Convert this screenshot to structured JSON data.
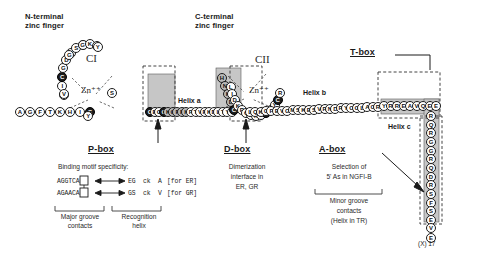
{
  "figure": {
    "title_regions": {
      "n_terminal": "N-terminal\nzinc finger",
      "c_terminal": "C-terminal\nzinc finger"
    },
    "zinc_modules": [
      {
        "id": "CI",
        "label": "CI",
        "zinc_label": "Zn⁺⁺"
      },
      {
        "id": "CII",
        "label": "CII",
        "zinc_label": "Zn⁺⁺"
      }
    ],
    "helices": [
      {
        "name": "helix-a",
        "label": "Helix a"
      },
      {
        "name": "helix-b",
        "label": "Helix b"
      },
      {
        "name": "helix-c",
        "label": "Helix c"
      }
    ],
    "terminus_label": "(X) 17"
  },
  "boxes": [
    {
      "name": "t-box",
      "label": "T-box",
      "caption_lines": []
    },
    {
      "name": "p-box",
      "label": "P-box",
      "caption_lines": [
        "Binding motif specificity:"
      ]
    },
    {
      "name": "d-box",
      "label": "D-box",
      "caption_lines": [
        "Dimerization",
        "interface in",
        "ER, GR"
      ]
    },
    {
      "name": "a-box",
      "label": "A-box",
      "caption_lines": [
        "Selection of",
        "5' As in NGFI-B"
      ]
    }
  ],
  "p_box_detail": {
    "heading": "Binding motif specificity:",
    "rows": [
      {
        "motif": "AGGTCA",
        "boxed_index": 3,
        "arrow": "←→",
        "residues": "EG  ck  A",
        "receptor": "[for ER]"
      },
      {
        "motif": "AGAACA",
        "boxed_index": 3,
        "arrow": "←→",
        "residues": "GS  ck  V",
        "receptor": "[for GR]"
      }
    ],
    "bracket_left": [
      "Major groove",
      "contacts"
    ],
    "bracket_right": [
      "Recognition",
      "helix"
    ]
  },
  "a_box_detail": {
    "bracket_lines": [
      "Minor groove",
      "contacts",
      "(Helix in TR)"
    ]
  },
  "sequence": {
    "n_tail": [
      "A",
      "G",
      "F",
      "T",
      "K",
      "H",
      "I",
      "C"
    ],
    "ci_loop_left": [
      "A",
      "I",
      "C",
      "G",
      "D",
      "R",
      "S",
      "S"
    ],
    "ci_loop_top": [
      "G",
      "K",
      "H"
    ],
    "ci_loop_right": [
      "Y",
      "G",
      "V",
      "Y",
      "S"
    ],
    "helix_a_chain": [
      "C",
      "E",
      "G",
      "C",
      "K",
      "G",
      "F",
      "F",
      "K",
      "R",
      "T",
      "V",
      "R",
      "K",
      "D",
      "L",
      "T",
      "Y",
      "T"
    ],
    "cii_left_block": [
      "H",
      "N",
      "K",
      "D",
      "C"
    ],
    "cii_loop": [
      "L",
      "I",
      "D",
      "K",
      "R",
      "Q",
      "R",
      "N",
      "R",
      "C",
      "Q",
      "Y",
      "C",
      "R"
    ],
    "helix_b_chain": [
      "L",
      "Q",
      "K",
      "C",
      "F",
      "E",
      "V",
      "G",
      "M",
      "S",
      "K",
      "E",
      "S",
      "V",
      "R",
      "N",
      "D",
      "R",
      "Y",
      "C",
      "C",
      "L",
      "A",
      "C",
      "R"
    ],
    "t_box_chain": [
      "Y",
      "R",
      "R",
      "E",
      "A",
      "V",
      "Q",
      "E",
      "E"
    ],
    "helix_c_tail": [
      "R",
      "Q",
      "R",
      "G",
      "G",
      "R",
      "Q",
      "D",
      "R",
      "S",
      "F",
      "S",
      "E"
    ],
    "end_beads": [
      "V",
      "E"
    ]
  },
  "colors": {
    "ink": "#1a1a1a",
    "bead_fill": "#ffffff",
    "cys_fill": "#1c1c1c",
    "shade_fill": "#b9b9b9",
    "box_shade": "#c6c6c6",
    "dash": "#3a3a3a"
  }
}
